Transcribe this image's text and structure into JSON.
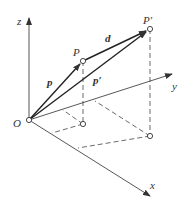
{
  "diagram": {
    "axes": {
      "x": {
        "label": "x"
      },
      "y": {
        "label": "y"
      },
      "z": {
        "label": "z"
      }
    },
    "points": {
      "origin": {
        "label": "O"
      },
      "P": {
        "label": "P"
      },
      "P_prime": {
        "label": "P′"
      }
    },
    "vectors": {
      "p": {
        "label": "p"
      },
      "p_prime": {
        "label": "p′"
      },
      "d": {
        "label": "d"
      }
    },
    "colors": {
      "line": "#333333",
      "background": "#ffffff"
    }
  }
}
